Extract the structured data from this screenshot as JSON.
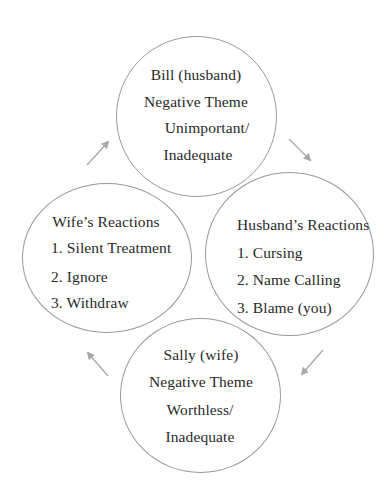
{
  "diagram": {
    "type": "cycle",
    "colors": {
      "circle_stroke": "#9a9a9a",
      "arrow": "#a8a8a8",
      "text": "#2a2a2a",
      "background": "#ffffff"
    },
    "nodes": [
      {
        "id": "bill",
        "position": "top",
        "lines": [
          "Bill (husband)",
          "Negative Theme",
          "Unimportant/",
          "Inadequate"
        ]
      },
      {
        "id": "husband-reactions",
        "position": "right",
        "lines": [
          "Husband’s Reactions",
          "1. Cursing",
          "2. Name Calling",
          "3. Blame (you)"
        ]
      },
      {
        "id": "sally",
        "position": "bottom",
        "lines": [
          "Sally (wife)",
          "Negative Theme",
          "Worthless/",
          "Inadequate"
        ]
      },
      {
        "id": "wife-reactions",
        "position": "left",
        "lines": [
          "Wife’s Reactions",
          "1. Silent Treatment",
          "2. Ignore",
          "3. Withdraw"
        ]
      }
    ],
    "edges": [
      {
        "from": "bill",
        "to": "husband-reactions",
        "direction": "clockwise"
      },
      {
        "from": "husband-reactions",
        "to": "sally",
        "direction": "clockwise"
      },
      {
        "from": "sally",
        "to": "wife-reactions",
        "direction": "clockwise"
      },
      {
        "from": "wife-reactions",
        "to": "bill",
        "direction": "clockwise"
      }
    ]
  }
}
